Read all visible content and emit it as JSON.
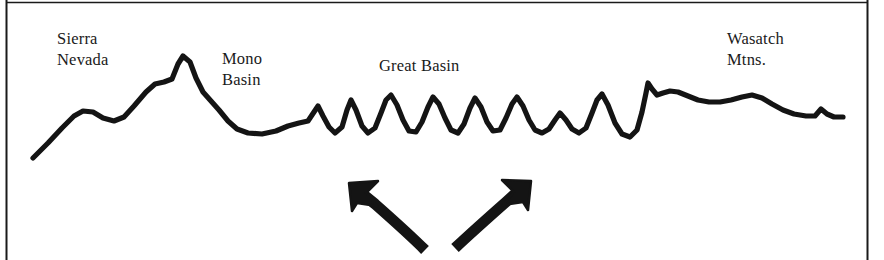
{
  "figure": {
    "kind": "geologic-cross-section",
    "width": 884,
    "height": 260,
    "background_color": "#ffffff",
    "ink_color": "#1a1a1a",
    "frame": {
      "left_rule": true,
      "right_rule": true,
      "top_rule": true,
      "bottom_rule": false
    }
  },
  "labels": {
    "sierra_nevada": "Sierra\nNevada",
    "mono_basin": "Mono\nBasin",
    "great_basin": "Great Basin",
    "wasatch_mtns": "Wasatch\nMtns."
  },
  "arrows": {
    "left": {
      "name": "extension-arrow-left",
      "direction": "up-left",
      "description": "curved arrow pointing up and to the left"
    },
    "right": {
      "name": "extension-arrow-right",
      "direction": "up-right",
      "description": "curved arrow pointing up and to the right"
    }
  },
  "chart_data": {
    "type": "line",
    "title": "",
    "xlabel": "",
    "ylabel": "",
    "grid": false,
    "legend": "none",
    "xlim": [
      33,
      843
    ],
    "ylim": [
      55,
      160
    ],
    "annotations": [
      {
        "text": "Sierra Nevada",
        "x": 57,
        "y": 28
      },
      {
        "text": "Mono Basin",
        "x": 222,
        "y": 48
      },
      {
        "text": "Great Basin",
        "x": 379,
        "y": 55
      },
      {
        "text": "Wasatch Mtns.",
        "x": 727,
        "y": 28
      }
    ],
    "series": [
      {
        "name": "topographic-profile",
        "points": [
          [
            33,
            158
          ],
          [
            48,
            143
          ],
          [
            62,
            128
          ],
          [
            74,
            116
          ],
          [
            83,
            111
          ],
          [
            93,
            112
          ],
          [
            103,
            118
          ],
          [
            114,
            121
          ],
          [
            124,
            117
          ],
          [
            134,
            106
          ],
          [
            146,
            92
          ],
          [
            155,
            84
          ],
          [
            164,
            82
          ],
          [
            172,
            79
          ],
          [
            178,
            64
          ],
          [
            183,
            56
          ],
          [
            190,
            62
          ],
          [
            196,
            78
          ],
          [
            203,
            92
          ],
          [
            211,
            101
          ],
          [
            219,
            110
          ],
          [
            228,
            121
          ],
          [
            237,
            129
          ],
          [
            248,
            133
          ],
          [
            262,
            134
          ],
          [
            276,
            131
          ],
          [
            288,
            126
          ],
          [
            299,
            123
          ],
          [
            308,
            121
          ],
          [
            314,
            112
          ],
          [
            318,
            106
          ],
          [
            323,
            116
          ],
          [
            329,
            127
          ],
          [
            335,
            133
          ],
          [
            342,
            127
          ],
          [
            347,
            110
          ],
          [
            351,
            100
          ],
          [
            356,
            110
          ],
          [
            362,
            126
          ],
          [
            368,
            133
          ],
          [
            375,
            128
          ],
          [
            381,
            113
          ],
          [
            386,
            100
          ],
          [
            391,
            95
          ],
          [
            397,
            105
          ],
          [
            403,
            120
          ],
          [
            409,
            131
          ],
          [
            416,
            132
          ],
          [
            422,
            122
          ],
          [
            428,
            107
          ],
          [
            433,
            97
          ],
          [
            439,
            104
          ],
          [
            445,
            118
          ],
          [
            451,
            130
          ],
          [
            458,
            133
          ],
          [
            464,
            124
          ],
          [
            470,
            108
          ],
          [
            475,
            98
          ],
          [
            481,
            107
          ],
          [
            487,
            122
          ],
          [
            493,
            131
          ],
          [
            500,
            130
          ],
          [
            506,
            118
          ],
          [
            512,
            104
          ],
          [
            517,
            97
          ],
          [
            523,
            106
          ],
          [
            529,
            120
          ],
          [
            535,
            130
          ],
          [
            542,
            133
          ],
          [
            549,
            129
          ],
          [
            555,
            120
          ],
          [
            560,
            113
          ],
          [
            566,
            120
          ],
          [
            572,
            129
          ],
          [
            579,
            133
          ],
          [
            586,
            128
          ],
          [
            592,
            113
          ],
          [
            597,
            100
          ],
          [
            602,
            94
          ],
          [
            608,
            105
          ],
          [
            615,
            123
          ],
          [
            622,
            134
          ],
          [
            630,
            137
          ],
          [
            637,
            130
          ],
          [
            642,
            112
          ],
          [
            646,
            93
          ],
          [
            648,
            83
          ],
          [
            652,
            89
          ],
          [
            657,
            95
          ],
          [
            663,
            93
          ],
          [
            670,
            91
          ],
          [
            678,
            92
          ],
          [
            688,
            96
          ],
          [
            698,
            100
          ],
          [
            709,
            102
          ],
          [
            720,
            102
          ],
          [
            731,
            100
          ],
          [
            742,
            97
          ],
          [
            752,
            95
          ],
          [
            762,
            98
          ],
          [
            772,
            104
          ],
          [
            783,
            110
          ],
          [
            794,
            114
          ],
          [
            806,
            116
          ],
          [
            815,
            116
          ],
          [
            821,
            109
          ],
          [
            827,
            114
          ],
          [
            834,
            117
          ],
          [
            843,
            117
          ]
        ]
      }
    ]
  }
}
